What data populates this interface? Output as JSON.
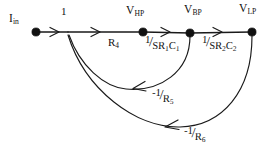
{
  "figure": {
    "kind": "signal-flow-graph",
    "background_color": "#ffffff",
    "ink_color": "#111111"
  },
  "nodes": [
    {
      "id": "iin",
      "label_main": "I",
      "label_sub": "in",
      "x": 36,
      "y": 32
    },
    {
      "id": "vhp",
      "label_main": "V",
      "label_sub": "HP",
      "x": 143,
      "y": 32
    },
    {
      "id": "vbp",
      "label_main": "V",
      "label_sub": "BP",
      "x": 190,
      "y": 33
    },
    {
      "id": "vlp",
      "label_main": "V",
      "label_sub": "LP",
      "x": 252,
      "y": 32
    }
  ],
  "forward_edges": [
    {
      "id": "e_in_hp_gain1",
      "from": "iin",
      "to": "junction",
      "label": "1"
    },
    {
      "id": "e_junction_hp",
      "from": "junction",
      "to": "vhp",
      "label": "R",
      "label_sub": "4"
    },
    {
      "id": "e_hp_bp",
      "from": "vhp",
      "to": "vbp",
      "numerator": "1",
      "solidus": "/",
      "denominator": "SR",
      "den_sub1": "1",
      "den_mid": "C",
      "den_sub2": "1"
    },
    {
      "id": "e_bp_lp",
      "from": "vbp",
      "to": "vlp",
      "numerator": "1",
      "solidus": "/",
      "denominator": "SR",
      "den_sub1": "2",
      "den_mid": "C",
      "den_sub2": "2"
    }
  ],
  "feedback_edges": [
    {
      "id": "f_bp_junction",
      "from": "vbp",
      "to": "junction",
      "sign": "-",
      "numerator": "1",
      "solidus": "/",
      "denominator": "R",
      "den_sub": "5"
    },
    {
      "id": "f_lp_junction",
      "from": "vlp",
      "to": "junction",
      "sign": "-",
      "numerator": "1",
      "solidus": "/",
      "denominator": "R",
      "den_sub": "6"
    }
  ],
  "labels": {
    "iin_main": "I",
    "iin_sub": "in",
    "gain_one": "1",
    "vhp_main": "V",
    "vhp_sub": "HP",
    "vbp_main": "V",
    "vbp_sub": "BP",
    "vlp_main": "V",
    "vlp_sub": "LP",
    "r4_main": "R",
    "r4_sub": "4",
    "g1_num": "1",
    "g1_sol": "/",
    "g1_den_a": "SR",
    "g1_den_a_sub": "1",
    "g1_den_b": "C",
    "g1_den_b_sub": "1",
    "g2_num": "1",
    "g2_sol": "/",
    "g2_den_a": "SR",
    "g2_den_a_sub": "2",
    "g2_den_b": "C",
    "g2_den_b_sub": "2",
    "f5_num": "-1",
    "f5_sol": "/",
    "f5_den": "R",
    "f5_den_sub": "5",
    "f6_num": "-1",
    "f6_sol": "/",
    "f6_den": "R",
    "f6_den_sub": "6"
  }
}
